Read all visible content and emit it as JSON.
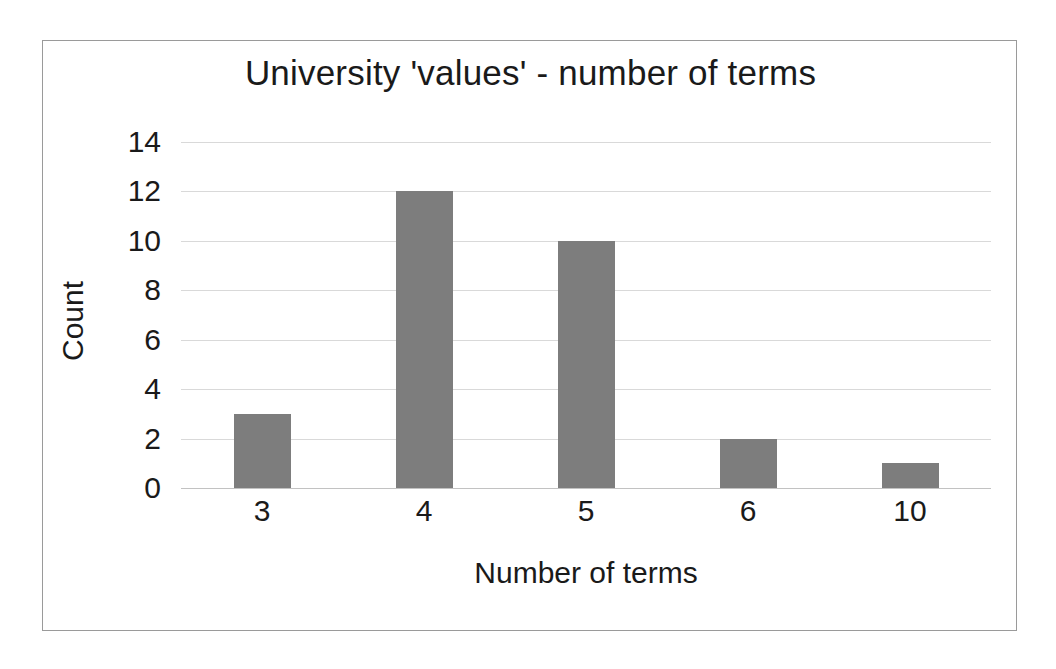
{
  "chart_data": {
    "type": "bar",
    "title": "University 'values' - number of terms",
    "xlabel": "Number of terms",
    "ylabel": "Count",
    "categories": [
      "3",
      "4",
      "5",
      "6",
      "10"
    ],
    "values": [
      3,
      12,
      10,
      2,
      1
    ],
    "ylim": [
      0,
      14
    ],
    "ytick_labels": [
      "0",
      "2",
      "4",
      "6",
      "8",
      "10",
      "12",
      "14"
    ],
    "ytick_values": [
      0,
      2,
      4,
      6,
      8,
      10,
      12,
      14
    ],
    "grid": "horizontal",
    "legend": "none",
    "series": [
      {
        "name": "Count",
        "values": [
          3,
          12,
          10,
          2,
          1
        ]
      }
    ],
    "colors": {
      "bar_fill": "#7d7d7d",
      "gridline": "#d9d9d9",
      "frame_border": "#9a9a9a",
      "text": "#1a1a1a",
      "background": "#ffffff"
    }
  }
}
